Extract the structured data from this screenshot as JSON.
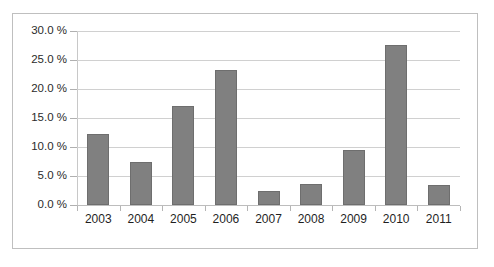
{
  "chart_data": {
    "type": "bar",
    "title": "",
    "subtitle": "",
    "xlabel": "",
    "ylabel": "",
    "categories": [
      "2003",
      "2004",
      "2005",
      "2006",
      "2007",
      "2008",
      "2009",
      "2010",
      "2011"
    ],
    "values": [
      12.3,
      7.4,
      17.0,
      23.2,
      2.4,
      3.7,
      9.4,
      27.6,
      3.5
    ],
    "ylim": [
      0.0,
      30.0
    ],
    "ytick_values": [
      30.0,
      25.0,
      20.0,
      15.0,
      10.0,
      5.0,
      0.0
    ],
    "ytick_labels": [
      "30.0 %",
      "25.0 %",
      "20.0 %",
      "15.0 %",
      "10.0 %",
      "5.0 %",
      "0.0 %"
    ],
    "grid": "horizontal",
    "legend": "none",
    "series": [
      {
        "name": "",
        "values": [
          12.3,
          7.4,
          17.0,
          23.2,
          2.4,
          3.7,
          9.4,
          27.6,
          3.5
        ],
        "color": "#808080"
      }
    ],
    "annotations": [],
    "colors": {
      "bar_fill": "#808080",
      "bar_border": "#6e6e6e",
      "gridline": "#d0d0d0",
      "axis_line": "#c8c8c8",
      "frame_border": "#bfbfbf",
      "plot_background": "#ffffff",
      "tick_label": "#1f1f1f"
    }
  }
}
